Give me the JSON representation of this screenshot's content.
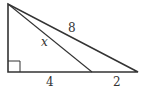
{
  "diagram": {
    "type": "right-triangle",
    "labels": {
      "hypotenuse": "8",
      "cevian": "x",
      "base_left": "4",
      "base_right": "2"
    },
    "colors": {
      "stroke": "#333333",
      "background": "#ffffff"
    }
  }
}
